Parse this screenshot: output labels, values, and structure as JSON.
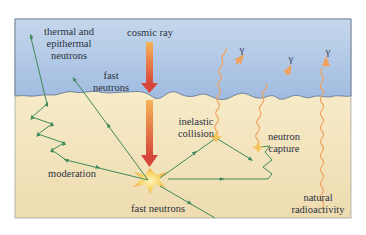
{
  "colors": {
    "sky_top": "#a9c3e2",
    "sky_bottom": "#c9daee",
    "ground_top": "#fbf1d2",
    "ground_bottom": "#efdfb5",
    "neutron_path": "#3e8a5a",
    "gamma_path": "#f1a15e",
    "cosmic_ray_top": "#f2a24e",
    "cosmic_ray_bottom": "#d8453a",
    "frame": "#9a9a9a"
  },
  "labels": {
    "cosmic_ray": "cosmic ray",
    "thermal_line1": "thermal and",
    "thermal_line2": "epithermal",
    "thermal_line3": "neutrons",
    "fast_top_line1": "fast",
    "fast_top_line2": "neutrons",
    "inelastic_line1": "inelastic",
    "inelastic_line2": "collision",
    "capture_line1": "neutron",
    "capture_line2": "capture",
    "moderation": "moderation",
    "fast_bottom": "fast neutrons",
    "natural_line1": "natural",
    "natural_line2": "radioactivity",
    "gamma": "γ"
  },
  "regions": [
    "atmosphere",
    "ground"
  ],
  "processes": [
    {
      "name": "cosmic ray incidence",
      "type": "primary"
    },
    {
      "name": "fast neutron escape",
      "type": "neutron"
    },
    {
      "name": "moderation to thermal/epithermal",
      "type": "neutron"
    },
    {
      "name": "inelastic collision",
      "emits": "gamma"
    },
    {
      "name": "neutron capture",
      "emits": "gamma"
    },
    {
      "name": "natural radioactivity",
      "emits": "gamma"
    }
  ]
}
